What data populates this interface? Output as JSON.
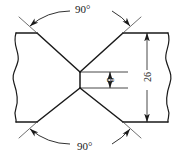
{
  "drawing": {
    "title": "Double-V groove weld joint cross-section",
    "type": "engineering-drawing",
    "stroke_color": "#1a1a1a",
    "thin_stroke_color": "#4a4a4a",
    "background": "#ffffff",
    "dimensions": {
      "angle_top": {
        "label": "90°",
        "value": 90,
        "unit": "degree",
        "name": "included-groove-angle-top"
      },
      "angle_bottom": {
        "label": "90°",
        "value": 90,
        "unit": "degree",
        "name": "included-groove-angle-bottom"
      },
      "root_face": {
        "label": "8",
        "value": 8,
        "name": "root-face-height"
      },
      "thickness": {
        "label": "26",
        "value": 26,
        "name": "plate-thickness"
      }
    },
    "geometry": {
      "body": {
        "left": 16,
        "right": 168,
        "top": 33,
        "bottom": 122
      },
      "center_x": 80,
      "root_top_y": 72,
      "root_bottom_y": 88,
      "bevel_top_left_x": 37,
      "bevel_top_right_x": 123,
      "bevel_bottom_left_x": 37,
      "bevel_bottom_right_x": 123
    }
  }
}
